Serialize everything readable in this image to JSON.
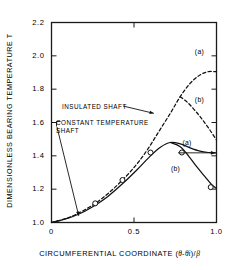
{
  "chart_data": {
    "type": "line",
    "title": "",
    "xlabel": "CIRCUMFERENTIAL COORDINATE (θ-θᵢ)/β",
    "xlabel_prefix": "CIRCUMFERENTIAL COORDINATE (",
    "xlabel_theta": "θ",
    "xlabel_minus": "-",
    "xlabel_theta_i": "θi",
    "xlabel_close": ")/",
    "xlabel_beta": "β",
    "ylabel": "DIMENSIONLESS BEARING TEMPERATURE T",
    "xlim": [
      0,
      1.0
    ],
    "ylim": [
      1.0,
      2.2
    ],
    "xticks": [
      0,
      0.5,
      1.0
    ],
    "xtick_labels": [
      "0",
      "0.5",
      "1.0"
    ],
    "yticks": [
      1.0,
      1.2,
      1.4,
      1.6,
      1.8,
      2.0,
      2.2
    ],
    "ytick_labels": [
      "1.0",
      "1.2",
      "1.4",
      "1.6",
      "1.8",
      "2.0",
      "2.2"
    ],
    "grid": false,
    "legend": "none",
    "series": [
      {
        "name": "insulated-shaft-a",
        "label": "(a)",
        "style": "dashed",
        "points": [
          [
            0.0,
            1.0
          ],
          [
            0.1,
            1.028
          ],
          [
            0.2,
            1.075
          ],
          [
            0.3,
            1.14
          ],
          [
            0.4,
            1.225
          ],
          [
            0.5,
            1.33
          ],
          [
            0.58,
            1.435
          ],
          [
            0.65,
            1.545
          ],
          [
            0.72,
            1.655
          ],
          [
            0.78,
            1.755
          ],
          [
            0.84,
            1.835
          ],
          [
            0.9,
            1.885
          ],
          [
            0.95,
            1.905
          ],
          [
            1.0,
            1.905
          ]
        ]
      },
      {
        "name": "insulated-shaft-b",
        "label": "(b)",
        "style": "dashed",
        "points": [
          [
            0.78,
            1.755
          ],
          [
            0.83,
            1.715
          ],
          [
            0.88,
            1.66
          ],
          [
            0.92,
            1.61
          ],
          [
            0.96,
            1.555
          ],
          [
            1.0,
            1.495
          ]
        ]
      },
      {
        "name": "constant-temperature-shaft-a",
        "label": "(a)",
        "style": "solid",
        "points": [
          [
            0.0,
            1.0
          ],
          [
            0.08,
            1.02
          ],
          [
            0.16,
            1.048
          ],
          [
            0.25,
            1.095
          ],
          [
            0.34,
            1.155
          ],
          [
            0.43,
            1.232
          ],
          [
            0.52,
            1.318
          ],
          [
            0.6,
            1.4
          ],
          [
            0.66,
            1.452
          ],
          [
            0.72,
            1.48
          ],
          [
            0.78,
            1.472
          ],
          [
            0.84,
            1.448
          ],
          [
            0.9,
            1.428
          ],
          [
            0.95,
            1.42
          ],
          [
            1.0,
            1.418
          ]
        ]
      },
      {
        "name": "constant-temperature-shaft-b",
        "label": "(b)",
        "style": "solid",
        "points": [
          [
            0.72,
            1.48
          ],
          [
            0.78,
            1.455
          ],
          [
            0.83,
            1.4
          ],
          [
            0.88,
            1.335
          ],
          [
            0.93,
            1.275
          ],
          [
            0.97,
            1.228
          ],
          [
            1.0,
            1.205
          ]
        ]
      }
    ],
    "data_points": {
      "name": "measured-data",
      "marker": "open-circle",
      "values": [
        [
          0.265,
          1.115
        ],
        [
          0.43,
          1.255
        ],
        [
          0.6,
          1.42
        ],
        [
          0.79,
          1.42
        ],
        [
          0.965,
          1.212
        ]
      ]
    },
    "annotations": [
      {
        "name": "insulated-shaft-annotation",
        "text": "INSULATED SHAFT",
        "target": [
          0.62,
          1.655
        ]
      },
      {
        "name": "constant-temperature-shaft-annotation",
        "line1": "CONSTANT TEMPERATURE",
        "line2": "SHAFT",
        "target": [
          0.165,
          1.04
        ]
      }
    ],
    "curve_labels": [
      {
        "name": "insulated-a-label",
        "text": "(a)",
        "x": 0.905,
        "y": 2.015
      },
      {
        "name": "insulated-b-label",
        "text": "(b)",
        "x": 0.905,
        "y": 1.73
      },
      {
        "name": "constant-a-label",
        "text": "(a)",
        "x": 0.83,
        "y": 1.47
      },
      {
        "name": "constant-b-label",
        "text": "(b)",
        "x": 0.76,
        "y": 1.318
      }
    ]
  },
  "colors": {
    "axis": "#1a1a1a",
    "curve": "#111111",
    "text": "#000000",
    "background": "#ffffff"
  }
}
